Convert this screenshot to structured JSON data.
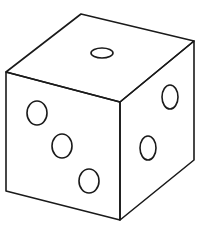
{
  "figure": {
    "stroke_color": "#1a1a1a",
    "background": "#ffffff",
    "faces": {
      "top": {
        "pips": 1
      },
      "left": {
        "pips": 3
      },
      "right": {
        "pips": 2
      }
    }
  }
}
